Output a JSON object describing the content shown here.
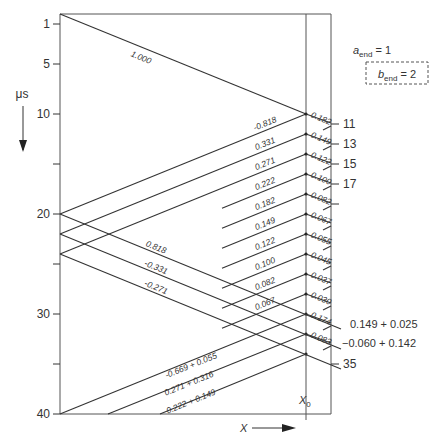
{
  "diagram": {
    "time_axis": {
      "unit_label": "μs",
      "direction": "down",
      "range": [
        0,
        40
      ],
      "left_ticks": [
        {
          "value": 1,
          "label": "1"
        },
        {
          "value": 5,
          "label": "5"
        },
        {
          "value": 10,
          "label": "10"
        },
        {
          "value": 15,
          "label": ""
        },
        {
          "value": 20,
          "label": "20"
        },
        {
          "value": 25,
          "label": ""
        },
        {
          "value": 30,
          "label": "30"
        },
        {
          "value": 35,
          "label": ""
        },
        {
          "value": 40,
          "label": "40"
        }
      ],
      "right_ticks": [
        {
          "value": 11,
          "label": "11"
        },
        {
          "value": 13,
          "label": "13"
        },
        {
          "value": 15,
          "label": "15"
        },
        {
          "value": 17,
          "label": "17"
        },
        {
          "value": 19,
          "label": ""
        },
        {
          "value": 35,
          "label": "35"
        }
      ]
    },
    "x_axis": {
      "label": "X",
      "point_label": "X",
      "point_sub": "0"
    },
    "end_conditions": {
      "a": {
        "main": "a",
        "sub": "end",
        "value": "= 1"
      },
      "b": {
        "main": "b",
        "sub": "end",
        "value": "= 2"
      }
    },
    "incident_label": "1.000",
    "upgoing_labels": [
      {
        "t0": 20,
        "t1": 10,
        "label": "-0.818"
      },
      {
        "t0": 22,
        "t1": 12,
        "label": "0.331"
      },
      {
        "t0": 24,
        "t1": 14,
        "label": "0.271"
      },
      {
        "t0": 26,
        "t1": 16,
        "label": "0.222"
      },
      {
        "t0": 28,
        "t1": 18,
        "label": "0.182"
      },
      {
        "t0": 30,
        "t1": 20,
        "label": "0.149"
      },
      {
        "t0": 32,
        "t1": 22,
        "label": "0.122"
      },
      {
        "t0": 34,
        "t1": 24,
        "label": "0.100"
      },
      {
        "t0": 36,
        "t1": 26,
        "label": "0.082"
      },
      {
        "t0": 38,
        "t1": 28,
        "label": "0.067"
      }
    ],
    "downgoing_labels": [
      {
        "t0": 20,
        "label": "0.818"
      },
      {
        "t0": 22,
        "label": "-0.331"
      },
      {
        "t0": 24,
        "label": "-0.271"
      }
    ],
    "node_labels": [
      "0.182",
      "0.149",
      "0.122",
      "0.100",
      "0.082",
      "0.067",
      "0.055",
      "0.045",
      "0.037",
      "0.030",
      "0.174",
      "0.083"
    ],
    "bottom_labels": [
      "-0.669 + 0.055",
      "0.271 + 0.316",
      "0.222 + 0.149"
    ],
    "side_notes": [
      "0.149 + 0.025",
      "−0.060 + 0.142"
    ],
    "right_tick_35": "35"
  }
}
